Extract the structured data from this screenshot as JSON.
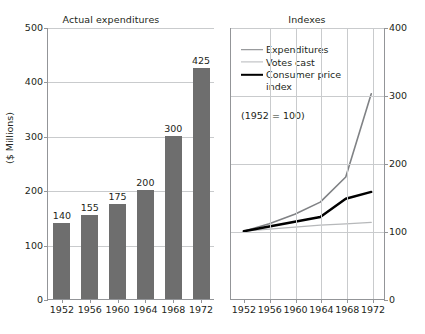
{
  "figure": {
    "background_color": "#ffffff",
    "bar_color": "#6e6e6e",
    "grid_color": "#c9cbcd",
    "axis_color": "#939598",
    "text_color": "#231f20"
  },
  "left": {
    "title": "Actual expenditures",
    "ylabel": "($ Millions)"
  },
  "right": {
    "title": "Indexes",
    "base_note": "(1952 = 100)",
    "legend": [
      {
        "label": "Expenditures",
        "color": "#808285"
      },
      {
        "label": "Votes cast",
        "color": "#b6b8ba"
      },
      {
        "label": "Consumer price\nindex",
        "color": "#000000"
      }
    ]
  },
  "chart_data": [
    {
      "type": "bar",
      "title": "Actual expenditures",
      "xlabel": "",
      "ylabel": "($ Millions)",
      "categories": [
        "1952",
        "1956",
        "1960",
        "1964",
        "1968",
        "1972"
      ],
      "values": [
        140,
        155,
        175,
        200,
        300,
        425
      ],
      "value_labels": [
        "140",
        "155",
        "175",
        "200",
        "300",
        "425"
      ],
      "ylim": [
        0,
        500
      ],
      "yticks": [
        0,
        100,
        200,
        300,
        400,
        500
      ],
      "ytick_labels": [
        "0",
        "100",
        "200",
        "300",
        "400",
        "500"
      ],
      "grid": true,
      "grid_axis": "y",
      "bar_color": "#6e6e6e",
      "legend": "none"
    },
    {
      "type": "line",
      "title": "Indexes",
      "xlabel": "",
      "ylabel": "",
      "annotation": "(1952 = 100)",
      "x": [
        "1952",
        "1956",
        "1960",
        "1964",
        "1968",
        "1972"
      ],
      "ylim": [
        0,
        400
      ],
      "yticks": [
        0,
        100,
        200,
        300,
        400
      ],
      "ytick_labels": [
        "0",
        "100",
        "200",
        "300",
        "400"
      ],
      "yaxis_position": "right",
      "grid": true,
      "legend_position": "upper-left",
      "series": [
        {
          "name": "Expenditures",
          "color": "#808285",
          "values": [
            100,
            111,
            125,
            143,
            180,
            303
          ]
        },
        {
          "name": "Votes cast",
          "color": "#b6b8ba",
          "values": [
            100,
            103,
            106,
            109,
            111,
            113
          ]
        },
        {
          "name": "Consumer price index",
          "color": "#000000",
          "values": [
            100,
            107,
            114,
            121,
            148,
            158
          ]
        }
      ]
    }
  ]
}
